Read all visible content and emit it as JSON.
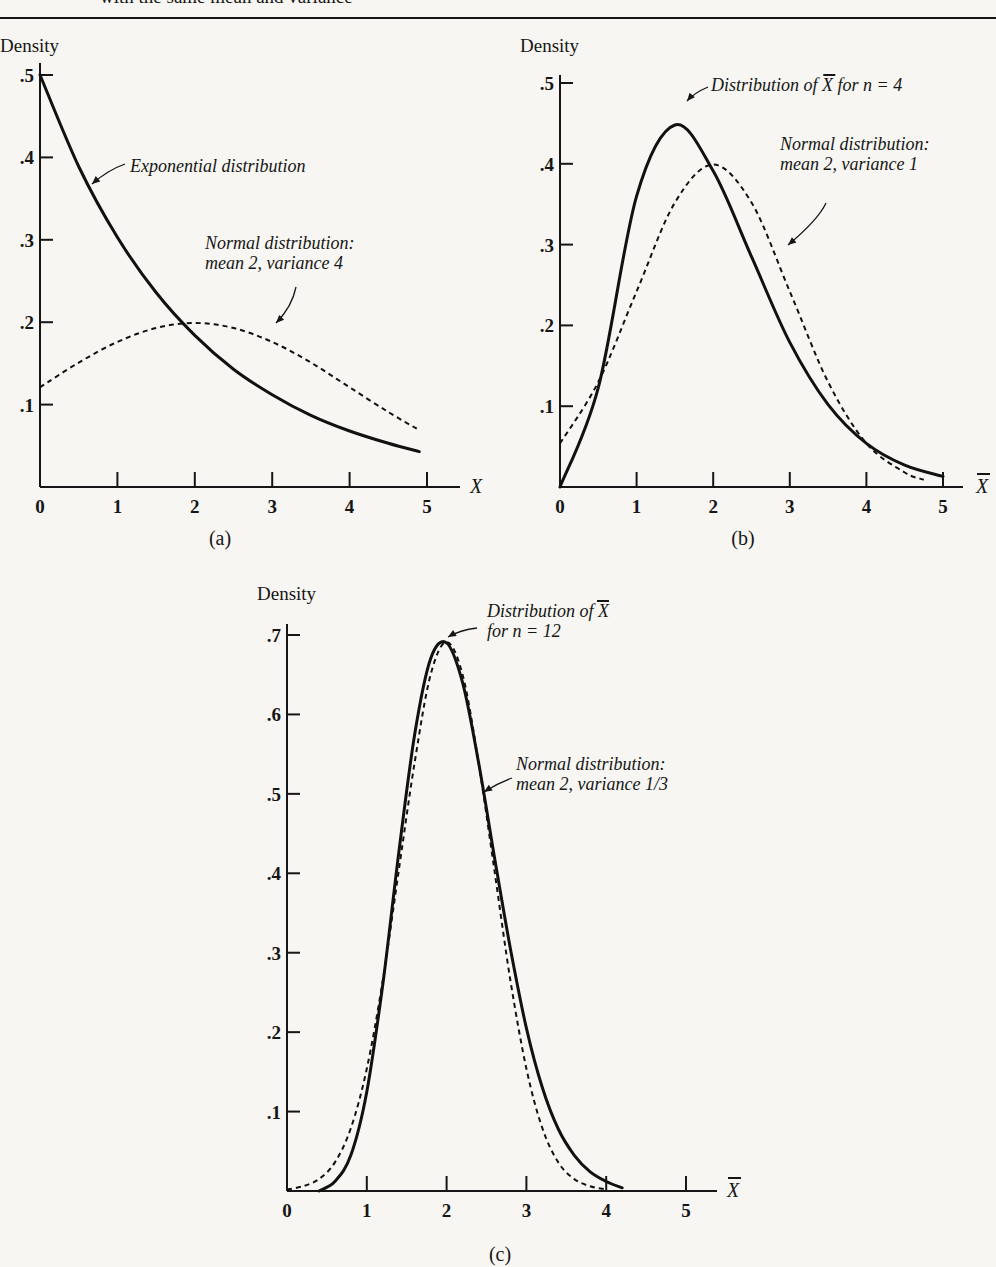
{
  "page": {
    "caption": "with the same mean and variance"
  },
  "chart_data": [
    {
      "id": "a",
      "type": "line",
      "panel_label": "(a)",
      "ylabel": "Density",
      "xlabel": "X",
      "xlabel_overbar": false,
      "xlim": [
        0,
        5
      ],
      "ylim": [
        0,
        0.5
      ],
      "x_ticks": [
        "0",
        "1",
        "2",
        "3",
        "4",
        "5"
      ],
      "y_ticks": [
        ".1",
        ".2",
        ".3",
        ".4",
        ".5"
      ],
      "y_tick_values": [
        0.1,
        0.2,
        0.3,
        0.4,
        0.5
      ],
      "series": [
        {
          "name": "Exponential distribution",
          "style": "solid",
          "x": [
            0,
            0.5,
            1,
            1.5,
            2,
            2.5,
            3,
            3.5,
            4,
            4.5,
            4.9
          ],
          "y": [
            0.5,
            0.389,
            0.303,
            0.236,
            0.184,
            0.143,
            0.112,
            0.087,
            0.068,
            0.053,
            0.043
          ]
        },
        {
          "name": "Normal distribution: mean 2, variance 4",
          "style": "dashed",
          "x": [
            0,
            0.5,
            1,
            1.5,
            2,
            2.5,
            3,
            3.5,
            4,
            4.5,
            4.9
          ],
          "y": [
            0.121,
            0.151,
            0.176,
            0.193,
            0.199,
            0.193,
            0.176,
            0.151,
            0.121,
            0.091,
            0.069
          ]
        }
      ],
      "annotations": [
        {
          "lines": [
            "Exponential distribution"
          ],
          "series": 0
        },
        {
          "lines": [
            "Normal distribution:",
            "mean 2, variance 4"
          ],
          "series": 1
        }
      ]
    },
    {
      "id": "b",
      "type": "line",
      "panel_label": "(b)",
      "ylabel": "Density",
      "xlabel": "X",
      "xlabel_overbar": true,
      "xlim": [
        0,
        5
      ],
      "ylim": [
        0,
        0.5
      ],
      "x_ticks": [
        "0",
        "1",
        "2",
        "3",
        "4",
        "5"
      ],
      "y_ticks": [
        ".1",
        ".2",
        ".3",
        ".4",
        ".5"
      ],
      "y_tick_values": [
        0.1,
        0.2,
        0.3,
        0.4,
        0.5
      ],
      "series": [
        {
          "name": "Distribution of X̄ for n = 4",
          "style": "solid",
          "x": [
            0,
            0.5,
            1,
            1.5,
            2,
            2.5,
            3,
            3.5,
            4,
            4.5,
            5
          ],
          "y": [
            0,
            0.123,
            0.36,
            0.448,
            0.391,
            0.285,
            0.179,
            0.102,
            0.054,
            0.027,
            0.013
          ]
        },
        {
          "name": "Normal distribution: mean 2, variance 1",
          "style": "dashed",
          "x": [
            0,
            0.5,
            1,
            1.5,
            2,
            2.5,
            3,
            3.5,
            4,
            4.5,
            4.75
          ],
          "y": [
            0.054,
            0.13,
            0.242,
            0.352,
            0.399,
            0.352,
            0.242,
            0.13,
            0.054,
            0.018,
            0.009
          ]
        }
      ],
      "annotations": [
        {
          "lines": [
            "Distribution of X for n = 4"
          ],
          "series": 0
        },
        {
          "lines": [
            "Normal distribution:",
            "mean 2, variance 1"
          ],
          "series": 1
        }
      ]
    },
    {
      "id": "c",
      "type": "line",
      "panel_label": "(c)",
      "ylabel": "Density",
      "xlabel": "X",
      "xlabel_overbar": true,
      "xlim": [
        0,
        5
      ],
      "ylim": [
        0,
        0.7
      ],
      "x_ticks": [
        "0",
        "1",
        "2",
        "3",
        "4",
        "5"
      ],
      "y_ticks": [
        ".1",
        ".2",
        ".3",
        ".4",
        ".5",
        ".6",
        ".7"
      ],
      "y_tick_values": [
        0.1,
        0.2,
        0.3,
        0.4,
        0.5,
        0.6,
        0.7
      ],
      "series": [
        {
          "name": "Distribution of X̄ for n = 12",
          "style": "solid",
          "x": [
            0.4,
            0.6,
            0.8,
            1,
            1.2,
            1.4,
            1.6,
            1.8,
            2,
            2.2,
            2.4,
            2.6,
            2.8,
            3,
            3.2,
            3.4,
            3.6,
            3.8,
            4,
            4.2
          ],
          "y": [
            0.0,
            0.012,
            0.045,
            0.125,
            0.26,
            0.425,
            0.575,
            0.67,
            0.69,
            0.64,
            0.54,
            0.42,
            0.305,
            0.205,
            0.13,
            0.078,
            0.045,
            0.024,
            0.012,
            0.004
          ]
        },
        {
          "name": "Normal distribution: mean 2, variance 1/3",
          "style": "dashed",
          "x": [
            0,
            0.2,
            0.4,
            0.6,
            0.8,
            1,
            1.2,
            1.4,
            1.6,
            1.8,
            2,
            2.2,
            2.4,
            2.6,
            2.8,
            3,
            3.2,
            3.4,
            3.6,
            3.8,
            4
          ],
          "y": [
            0.002,
            0.006,
            0.015,
            0.036,
            0.079,
            0.154,
            0.265,
            0.403,
            0.54,
            0.65,
            0.691,
            0.65,
            0.54,
            0.403,
            0.265,
            0.154,
            0.079,
            0.036,
            0.015,
            0.006,
            0.002
          ]
        }
      ],
      "annotations": [
        {
          "lines": [
            "Distribution of X",
            "for n = 12"
          ],
          "series": 0
        },
        {
          "lines": [
            "Normal distribution:",
            "mean 2, variance 1/3"
          ],
          "series": 1
        }
      ]
    }
  ]
}
